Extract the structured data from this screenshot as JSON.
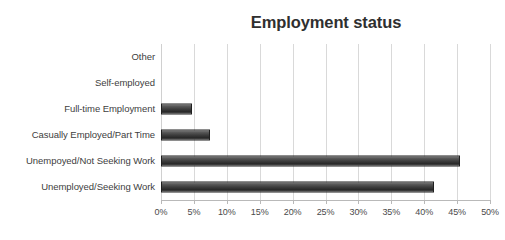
{
  "clipped_text_above": "",
  "chart_data": {
    "type": "bar",
    "orientation": "horizontal",
    "title": "Employment status",
    "xlabel": "",
    "ylabel": "",
    "xlim": [
      0,
      50
    ],
    "grid": true,
    "legend": false,
    "value_suffix": "%",
    "categories": [
      "Other",
      "Self-employed",
      "Full-time Employment",
      "Casually Employed/Part Time",
      "Unempoyed/Not Seeking Work",
      "Unemployed/Seeking Work"
    ],
    "values": [
      0,
      0,
      4.7,
      7.5,
      45.5,
      41.5
    ],
    "tick_labels": [
      "0%",
      "5%",
      "10%",
      "15%",
      "20%",
      "25%",
      "30%",
      "35%",
      "40%",
      "45%",
      "50%"
    ],
    "tick_values": [
      0,
      5,
      10,
      15,
      20,
      25,
      30,
      35,
      40,
      45,
      50
    ],
    "colors": {
      "bar_dark": "#2a2a2a",
      "bar_light": "#7c7c7c",
      "bar_border": "#1f1f1f",
      "gridline": "#d9d9d9",
      "title": "#2f2f2f",
      "label": "#404040",
      "background": "#ffffff"
    }
  }
}
